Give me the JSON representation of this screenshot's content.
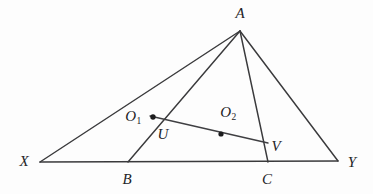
{
  "figure": {
    "background_color": "#fdfdfd",
    "stroke_color": "#3a3a3c",
    "label_color": "#232326",
    "width": 373,
    "height": 194,
    "labels": {
      "A": "A",
      "X": "X",
      "Y": "Y",
      "B": "B",
      "C": "C",
      "U": "U",
      "V": "V",
      "O1_main": "O",
      "O1_sub": "1",
      "O2_main": "O",
      "O2_sub": "2"
    },
    "points": [
      {
        "name": "A",
        "x": 240,
        "y": 31,
        "label_x": 240,
        "label_y": 13,
        "dot": false
      },
      {
        "name": "X",
        "x": 40,
        "y": 162,
        "label_x": 24,
        "label_y": 161,
        "dot": false
      },
      {
        "name": "Y",
        "x": 338,
        "y": 161,
        "label_x": 352,
        "label_y": 162,
        "dot": false
      },
      {
        "name": "B",
        "x": 128,
        "y": 162,
        "label_x": 127,
        "label_y": 179,
        "dot": false
      },
      {
        "name": "C",
        "x": 268,
        "y": 162,
        "label_x": 267,
        "label_y": 179,
        "dot": false
      },
      {
        "name": "U",
        "x": 157,
        "y": 121,
        "label_x": 163,
        "label_y": 134,
        "dot": false
      },
      {
        "name": "V",
        "x": 268,
        "y": 143,
        "label_x": 276,
        "label_y": 146,
        "dot": false
      },
      {
        "name": "O1",
        "x": 153,
        "y": 117,
        "label_x": 133,
        "label_y": 116,
        "dot": true
      },
      {
        "name": "O2",
        "x": 221,
        "y": 134,
        "label_x": 228,
        "label_y": 112,
        "dot": true
      }
    ],
    "segments": [
      {
        "name": "base-XY",
        "from": "X",
        "to": "Y"
      },
      {
        "name": "side-XA",
        "from": "X",
        "to": "A"
      },
      {
        "name": "side-AY",
        "from": "A",
        "to": "Y"
      },
      {
        "name": "cevian-AB",
        "from": "A",
        "to": "B"
      },
      {
        "name": "cevian-AC",
        "from": "A",
        "to": "C"
      },
      {
        "name": "chord-UV",
        "from": "U",
        "to": "V"
      }
    ]
  }
}
